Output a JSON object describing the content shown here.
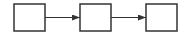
{
  "diagram": {
    "type": "flow",
    "stroke_color": "#333333",
    "background": "#ffffff",
    "nodes": [
      {
        "id": "box-1",
        "label": ""
      },
      {
        "id": "box-2",
        "label": ""
      },
      {
        "id": "box-3",
        "label": ""
      }
    ],
    "edges": [
      {
        "from": "box-1",
        "to": "box-2"
      },
      {
        "from": "box-2",
        "to": "box-3"
      }
    ]
  }
}
